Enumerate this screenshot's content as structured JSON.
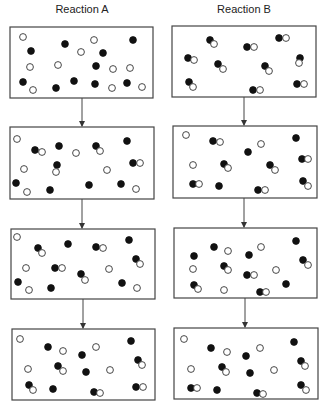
{
  "titles": {
    "reaction_a": "Reaction A",
    "reaction_b": "Reaction B"
  },
  "legend_colors": {
    "filled": "#111111",
    "open": "#ffffff",
    "stroke": "#333333"
  },
  "boxes": [
    {
      "id": "A1",
      "x": 10,
      "y": 27,
      "w": 143,
      "h": 71,
      "filled": [
        [
          31,
          51
        ],
        [
          65,
          44
        ],
        [
          133,
          40
        ],
        [
          103,
          53
        ],
        [
          96,
          66
        ],
        [
          23,
          82
        ],
        [
          56,
          88
        ],
        [
          74,
          81
        ],
        [
          95,
          84
        ],
        [
          127,
          83
        ]
      ],
      "open": [
        [
          23,
          37
        ],
        [
          94,
          40
        ],
        [
          81,
          52
        ],
        [
          30,
          67
        ],
        [
          58,
          65
        ],
        [
          113,
          69
        ],
        [
          130,
          68
        ],
        [
          33,
          90
        ],
        [
          112,
          88
        ],
        [
          142,
          87
        ]
      ]
    },
    {
      "id": "B1",
      "x": 172,
      "y": 26,
      "w": 144,
      "h": 71,
      "filled": [
        [
          210,
          40
        ],
        [
          247,
          47
        ],
        [
          279,
          38
        ],
        [
          188,
          58
        ],
        [
          218,
          64
        ],
        [
          265,
          66
        ],
        [
          300,
          58
        ],
        [
          189,
          82
        ],
        [
          253,
          90
        ],
        [
          297,
          84
        ]
      ],
      "open": [
        [
          214,
          44
        ],
        [
          254,
          47
        ],
        [
          286,
          38
        ],
        [
          194,
          60
        ],
        [
          223,
          69
        ],
        [
          269,
          71
        ],
        [
          299,
          63
        ],
        [
          193,
          87
        ],
        [
          260,
          90
        ],
        [
          304,
          84
        ]
      ]
    },
    {
      "id": "A2",
      "x": 10,
      "y": 127,
      "w": 144,
      "h": 72,
      "filled": [
        [
          35,
          150
        ],
        [
          59,
          146
        ],
        [
          96,
          146
        ],
        [
          127,
          141
        ],
        [
          57,
          165
        ],
        [
          133,
          163
        ],
        [
          16,
          183
        ],
        [
          50,
          190
        ],
        [
          89,
          185
        ],
        [
          121,
          184
        ]
      ],
      "open": [
        [
          17,
          139
        ],
        [
          42,
          152
        ],
        [
          76,
          153
        ],
        [
          100,
          151
        ],
        [
          24,
          169
        ],
        [
          56,
          172
        ],
        [
          107,
          170
        ],
        [
          140,
          163
        ],
        [
          27,
          192
        ],
        [
          136,
          189
        ]
      ]
    },
    {
      "id": "B2",
      "x": 173,
      "y": 126,
      "w": 144,
      "h": 72,
      "filled": [
        [
          213,
          141
        ],
        [
          248,
          152
        ],
        [
          296,
          138
        ],
        [
          302,
          159
        ],
        [
          224,
          164
        ],
        [
          270,
          165
        ],
        [
          193,
          184
        ],
        [
          219,
          186
        ],
        [
          258,
          190
        ],
        [
          303,
          181
        ]
      ],
      "open": [
        [
          186,
          135
        ],
        [
          220,
          142
        ],
        [
          261,
          144
        ],
        [
          308,
          159
        ],
        [
          193,
          165
        ],
        [
          228,
          168
        ],
        [
          275,
          170
        ],
        [
          199,
          184
        ],
        [
          265,
          190
        ],
        [
          308,
          186
        ]
      ]
    },
    {
      "id": "A3",
      "x": 11,
      "y": 229,
      "w": 144,
      "h": 70,
      "filled": [
        [
          38,
          248
        ],
        [
          68,
          244
        ],
        [
          96,
          247
        ],
        [
          129,
          240
        ],
        [
          136,
          259
        ],
        [
          55,
          268
        ],
        [
          81,
          274
        ],
        [
          18,
          282
        ],
        [
          51,
          288
        ],
        [
          122,
          283
        ]
      ],
      "open": [
        [
          17,
          237
        ],
        [
          42,
          253
        ],
        [
          103,
          248
        ],
        [
          140,
          264
        ],
        [
          26,
          268
        ],
        [
          62,
          268
        ],
        [
          109,
          269
        ],
        [
          85,
          280
        ],
        [
          29,
          290
        ],
        [
          137,
          288
        ]
      ]
    },
    {
      "id": "B3",
      "x": 174,
      "y": 228,
      "w": 143,
      "h": 70,
      "filled": [
        [
          214,
          247
        ],
        [
          194,
          256
        ],
        [
          249,
          255
        ],
        [
          296,
          241
        ],
        [
          303,
          260
        ],
        [
          224,
          266
        ],
        [
          247,
          275
        ],
        [
          194,
          285
        ],
        [
          260,
          292
        ],
        [
          286,
          284
        ]
      ],
      "open": [
        [
          228,
          251
        ],
        [
          193,
          269
        ],
        [
          261,
          247
        ],
        [
          308,
          265
        ],
        [
          228,
          270
        ],
        [
          254,
          275
        ],
        [
          276,
          270
        ],
        [
          198,
          289
        ],
        [
          224,
          290
        ],
        [
          266,
          292
        ]
      ]
    },
    {
      "id": "A4",
      "x": 12,
      "y": 329,
      "w": 143,
      "h": 71,
      "filled": [
        [
          48,
          347
        ],
        [
          131,
          341
        ],
        [
          82,
          355
        ],
        [
          138,
          360
        ],
        [
          58,
          366
        ],
        [
          86,
          372
        ],
        [
          29,
          385
        ],
        [
          53,
          389
        ],
        [
          94,
          392
        ],
        [
          136,
          387
        ]
      ],
      "open": [
        [
          20,
          339
        ],
        [
          63,
          351
        ],
        [
          96,
          347
        ],
        [
          142,
          365
        ],
        [
          28,
          369
        ],
        [
          63,
          371
        ],
        [
          110,
          370
        ],
        [
          33,
          390
        ],
        [
          100,
          393
        ],
        [
          143,
          387
        ]
      ]
    },
    {
      "id": "B4",
      "x": 174,
      "y": 328,
      "w": 144,
      "h": 71,
      "filled": [
        [
          211,
          348
        ],
        [
          294,
          342
        ],
        [
          246,
          356
        ],
        [
          301,
          361
        ],
        [
          222,
          367
        ],
        [
          250,
          373
        ],
        [
          191,
          388
        ],
        [
          217,
          390
        ],
        [
          257,
          393
        ],
        [
          301,
          385
        ]
      ],
      "open": [
        [
          184,
          339
        ],
        [
          227,
          352
        ],
        [
          260,
          348
        ],
        [
          305,
          366
        ],
        [
          191,
          369
        ],
        [
          226,
          372
        ],
        [
          274,
          370
        ],
        [
          197,
          388
        ],
        [
          263,
          394
        ],
        [
          306,
          390
        ]
      ]
    }
  ],
  "arrows": [
    {
      "x": 82,
      "y1": 98,
      "y2": 127
    },
    {
      "x": 82,
      "y1": 199,
      "y2": 229
    },
    {
      "x": 83,
      "y1": 299,
      "y2": 329
    },
    {
      "x": 244,
      "y1": 97,
      "y2": 126
    },
    {
      "x": 244,
      "y1": 198,
      "y2": 228
    },
    {
      "x": 245,
      "y1": 298,
      "y2": 328
    }
  ]
}
